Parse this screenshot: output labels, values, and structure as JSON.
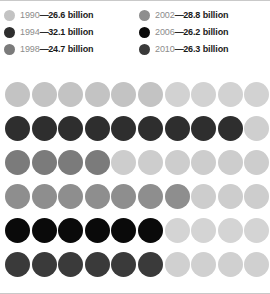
{
  "chart_data": {
    "type": "bar",
    "chart_style": "isotype-dot-matrix",
    "title": "",
    "subtitle": "",
    "xlabel": "",
    "ylabel": "",
    "unit": "billion",
    "dots_per_row": 10,
    "dot_value": 4,
    "grid_on": false,
    "legend_position": "top",
    "categories": [
      "1990",
      "1994",
      "1998",
      "2002",
      "2006",
      "2010"
    ],
    "values": [
      26.6,
      32.1,
      24.7,
      28.8,
      26.2,
      26.3
    ],
    "value_labels": [
      "26.6 billion",
      "32.1 billion",
      "24.7 billion",
      "28.8 billion",
      "26.2 billion",
      "26.3 billion"
    ],
    "filled_dots": [
      6,
      9,
      4,
      7,
      6,
      6
    ],
    "series": [
      {
        "name": "1990",
        "value": 26.6,
        "value_text": "26.6 billion",
        "filled": 6,
        "total": 10,
        "fill_color": "#c3c3c3",
        "empty_color": "#d2d2d2"
      },
      {
        "name": "1994",
        "value": 32.1,
        "value_text": "32.1 billion",
        "filled": 9,
        "total": 10,
        "fill_color": "#2e2e2e",
        "empty_color": "#cfcfcf"
      },
      {
        "name": "1998",
        "value": 24.7,
        "value_text": "24.7 billion",
        "filled": 4,
        "total": 10,
        "fill_color": "#7b7b7b",
        "empty_color": "#cdcdcd"
      },
      {
        "name": "2002",
        "value": 28.8,
        "value_text": "28.8 billion",
        "filled": 7,
        "total": 10,
        "fill_color": "#8e8e8e",
        "empty_color": "#cdcdcd"
      },
      {
        "name": "2006",
        "value": 26.2,
        "value_text": "26.2 billion",
        "filled": 6,
        "total": 10,
        "fill_color": "#0a0a0a",
        "empty_color": "#d4d4d4"
      },
      {
        "name": "2010",
        "value": 26.3,
        "value_text": "26.3 billion",
        "filled": 6,
        "total": 10,
        "fill_color": "#3a3a3a",
        "empty_color": "#d0d0d0"
      }
    ]
  },
  "legend": {
    "separator": "—",
    "columns": [
      {
        "items": [
          {
            "year": "1990",
            "value": "26.6 billion",
            "swatch_color": "#c3c3c3"
          },
          {
            "year": "1994",
            "value": "32.1 billion",
            "swatch_color": "#2e2e2e"
          },
          {
            "year": "1998",
            "value": "24.7 billion",
            "swatch_color": "#7b7b7b"
          }
        ]
      },
      {
        "items": [
          {
            "year": "2002",
            "value": "28.8 billion",
            "swatch_color": "#8e8e8e"
          },
          {
            "year": "2006",
            "value": "26.2 billion",
            "swatch_color": "#0a0a0a"
          },
          {
            "year": "2010",
            "value": "26.3 billion",
            "swatch_color": "#3a3a3a"
          }
        ]
      }
    ]
  },
  "colors": {
    "background": "#ffffff",
    "border": "#c9c9c9",
    "year_text": "#8c8c8c",
    "value_text": "#1a1a1a"
  }
}
